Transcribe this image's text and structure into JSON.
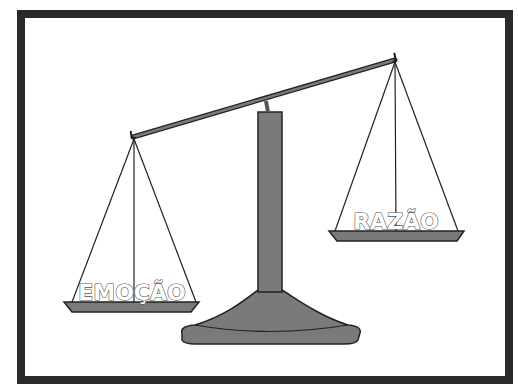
{
  "diagram": {
    "type": "balance-scale",
    "left_pan": {
      "label": "EMOÇÃO",
      "position": "lower"
    },
    "right_pan": {
      "label": "RAZÃO",
      "position": "higher"
    },
    "colors": {
      "frame": "#2a2a2a",
      "metal": "#7a7a7a",
      "line": "#222222"
    }
  }
}
